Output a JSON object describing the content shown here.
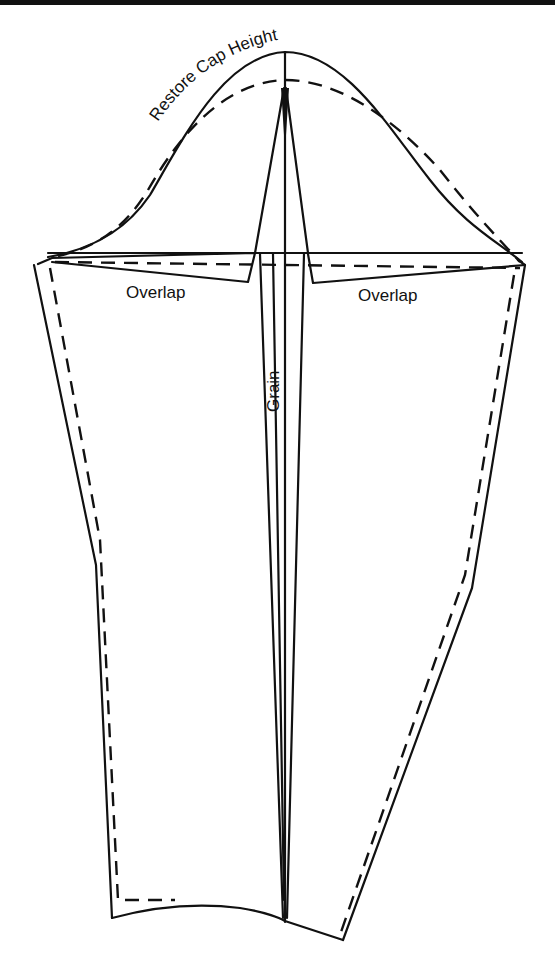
{
  "diagram": {
    "labels": {
      "cap_height": "Restore Cap Height",
      "overlap_left": "Overlap",
      "overlap_right": "Overlap",
      "grain": "Grain"
    },
    "colors": {
      "line": "#111111",
      "background": "#ffffff"
    },
    "line_styles": {
      "original_pattern": "dashed",
      "adjusted_pattern": "solid"
    }
  }
}
